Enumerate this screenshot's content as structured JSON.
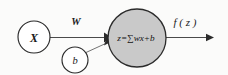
{
  "diagram": {
    "background_color": "#fbfbfa",
    "nodes": {
      "input": {
        "label": "X",
        "shape": "circle",
        "fill_color": "#ffffff",
        "stroke_color": "#2b2b2b",
        "center_x": 34,
        "center_y": 37,
        "radius": 16
      },
      "bias": {
        "label": "b",
        "shape": "circle",
        "fill_color": "#ffffff",
        "stroke_color": "#2b2b2b",
        "center_x": 75,
        "center_y": 60,
        "radius": 13
      },
      "summation": {
        "label": "z=∑wx+b",
        "label_parts": {
          "variable": "z",
          "equals": "=",
          "sigma": "∑",
          "weight": "w",
          "input": "x",
          "plus": "+",
          "bias": "b"
        },
        "shape": "circle",
        "fill_color": "#c9c9c9",
        "stroke_color": "#2b2b2b",
        "center_x": 137,
        "center_y": 38,
        "radius": 29
      }
    },
    "edges": {
      "weight_edge": {
        "label": "W",
        "from": "input",
        "to": "summation",
        "arrowhead": true,
        "stroke_color": "#4a4a4a"
      },
      "bias_edge": {
        "label": "",
        "from": "bias",
        "to": "summation",
        "arrowhead": true,
        "stroke_color": "#6a6a6a"
      },
      "output_edge": {
        "label": "f ( z )",
        "from": "summation",
        "to": "output",
        "arrowhead": true,
        "stroke_color": "#4a4a4a"
      }
    }
  }
}
